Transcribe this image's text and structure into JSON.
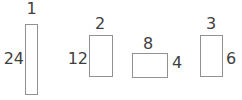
{
  "colors": {
    "background": "#ffffff",
    "rect_border": "#919191",
    "label_text": "#3f3f3f"
  },
  "figure": {
    "rectangles": [
      {
        "top_label": "1",
        "side_label": "24",
        "side_label_position": "left"
      },
      {
        "top_label": "2",
        "side_label": "12",
        "side_label_position": "left"
      },
      {
        "top_label": "8",
        "side_label": "4",
        "side_label_position": "right"
      },
      {
        "top_label": "3",
        "side_label": "6",
        "side_label_position": "right"
      }
    ]
  }
}
